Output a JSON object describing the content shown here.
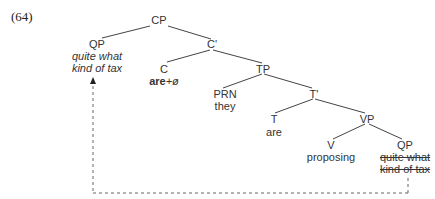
{
  "example_number": "(64)",
  "nodes": {
    "cp": {
      "label": "CP"
    },
    "qp_spec": {
      "label": "QP",
      "word_line1": "quite what",
      "word_line2": "kind of tax"
    },
    "c_bar": {
      "label": "C'"
    },
    "c": {
      "label": "C",
      "word_bold": "are",
      "word_suffix": "+ø"
    },
    "tp": {
      "label": "TP"
    },
    "prn": {
      "label": "PRN",
      "word": "they"
    },
    "t_bar": {
      "label": "T'"
    },
    "t": {
      "label": "T",
      "word": "are"
    },
    "vp": {
      "label": "VP"
    },
    "v": {
      "label": "V",
      "word": "proposing"
    },
    "qp_trace": {
      "label": "QP",
      "word_line1": "quite what",
      "word_line2": "kind of tax"
    }
  },
  "colors": {
    "line": "#444444",
    "text": "#333333",
    "dashed": "#666666"
  }
}
